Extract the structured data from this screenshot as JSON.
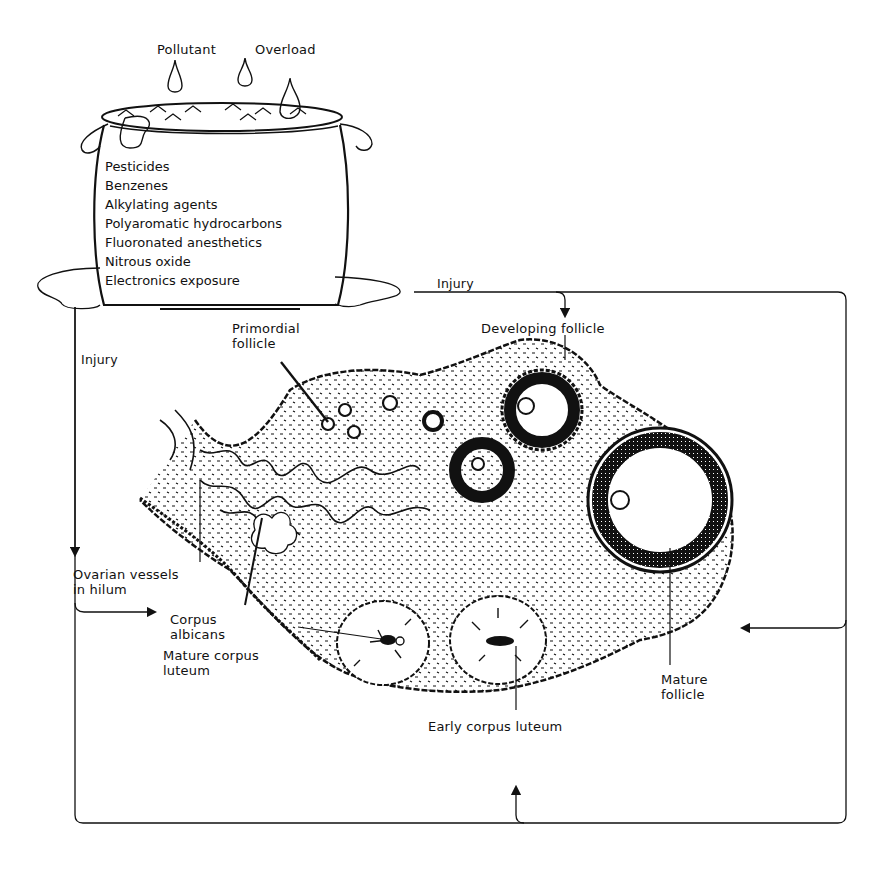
{
  "pot": {
    "title_left": "Pollutant",
    "title_right": "Overload",
    "pollutants": [
      "Pesticides",
      "Benzenes",
      "Alkylating agents",
      "Polyaromatic hydrocarbons",
      "Fluoronated anesthetics",
      "Nitrous oxide",
      "Electronics exposure"
    ]
  },
  "arrows": {
    "injury_top": "Injury",
    "injury_left": "Injury"
  },
  "ovary_labels": {
    "primordial_follicle_1": "Primordial",
    "primordial_follicle_2": "follicle",
    "developing_follicle": "Developing follicle",
    "ovarian_vessels_1": "Ovarian vessels",
    "ovarian_vessels_2": "in hilum",
    "corpus_albicans_1": "Corpus",
    "corpus_albicans_2": "albicans",
    "mature_corpus_luteum_1": "Mature corpus",
    "mature_corpus_luteum_2": "luteum",
    "mature_follicle_1": "Mature",
    "mature_follicle_2": "follicle",
    "early_corpus_luteum": "Early corpus luteum"
  },
  "colors": {
    "ink": "#111111",
    "background": "#ffffff"
  }
}
